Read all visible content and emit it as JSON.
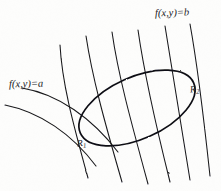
{
  "figure": {
    "kind": "hand-drawn-math-diagram",
    "width": 221,
    "height": 191,
    "background_color": "#fdfdfc",
    "ink_color": "#16161a"
  },
  "labels": {
    "level_a": "f(x,y)=a",
    "level_b": "f(x,y)=b",
    "point_1": "R",
    "point_1_sub": "1",
    "point_2": "R",
    "point_2_sub": "2"
  },
  "chart_data": {
    "type": "line",
    "title": "",
    "xlabel": "",
    "ylabel": "",
    "grid": false,
    "legend": "none",
    "xlim": [
      0,
      221
    ],
    "ylim": [
      191,
      0
    ],
    "annotations": [
      {
        "text": "f(x,y)=a",
        "x": 9,
        "y": 79,
        "role": "level-curve-label-left"
      },
      {
        "text": "f(x,y)=b",
        "x": 155,
        "y": 8,
        "role": "level-curve-label-right"
      },
      {
        "text": "R1",
        "x": 77,
        "y": 139,
        "role": "tangency-point-label"
      },
      {
        "text": "R2",
        "x": 190,
        "y": 85,
        "role": "tangency-point-label"
      }
    ],
    "series": [
      {
        "name": "level-curve-1",
        "role": "level curve of f, value a",
        "path": "M 5,105 C 40,112 72,134 96,166",
        "x": [
          5,
          40,
          72,
          96
        ],
        "y": [
          105,
          112,
          134,
          166
        ]
      },
      {
        "name": "level-curve-2",
        "role": "level curve of f",
        "path": "M 22,88 C 58,94 92,118 118,152",
        "x": [
          22,
          58,
          92,
          118
        ],
        "y": [
          88,
          94,
          118,
          152
        ]
      },
      {
        "name": "level-curve-3",
        "role": "level curve of f, tangent at R1",
        "path": "M 60,45 C 62,82 72,120 88,178",
        "x": [
          60,
          62,
          72,
          88
        ],
        "y": [
          45,
          82,
          120,
          178
        ]
      },
      {
        "name": "level-curve-4",
        "role": "level curve of f",
        "path": "M 86,36 C 92,76 104,120 122,182",
        "x": [
          86,
          92,
          104,
          122
        ],
        "y": [
          36,
          76,
          120,
          182
        ]
      },
      {
        "name": "level-curve-5",
        "role": "level curve of f",
        "path": "M 112,32 C 118,74 130,118 148,184",
        "x": [
          112,
          118,
          130,
          148
        ],
        "y": [
          32,
          74,
          118,
          184
        ]
      },
      {
        "name": "level-curve-6",
        "role": "level curve of f",
        "path": "M 138,30 C 144,72 154,118 170,182",
        "x": [
          138,
          144,
          154,
          170
        ],
        "y": [
          30,
          72,
          118,
          182
        ]
      },
      {
        "name": "level-curve-7",
        "role": "level curve of f, tangent at R2",
        "path": "M 165,26 C 172,70 180,120 190,180",
        "x": [
          165,
          172,
          180,
          190
        ],
        "y": [
          26,
          70,
          120,
          180
        ]
      },
      {
        "name": "level-curve-8",
        "role": "level curve of f, value b",
        "path": "M 190,24 C 198,68 204,120 210,176",
        "x": [
          190,
          198,
          204,
          210
        ],
        "y": [
          24,
          68,
          120,
          176
        ]
      },
      {
        "name": "constraint-ellipse",
        "role": "closed constraint curve tangent to level curves at R1 and R2",
        "type": "closed-ellipse",
        "center_x": 137,
        "center_y": 108,
        "radius_x": 62,
        "radius_y": 31,
        "rotation_deg": -24,
        "tangency_points": [
          {
            "label": "R1",
            "x": 86,
            "y": 143
          },
          {
            "label": "R2",
            "x": 190,
            "y": 89
          }
        ]
      }
    ]
  }
}
